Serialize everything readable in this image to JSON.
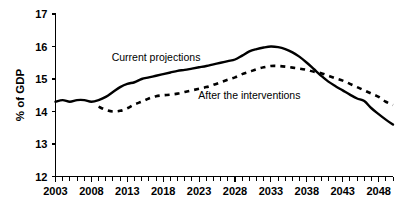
{
  "chart_data": {
    "type": "line",
    "title": "",
    "xlabel": "",
    "ylabel": "% of GDP",
    "xlim": [
      2003,
      2050
    ],
    "ylim": [
      12,
      17
    ],
    "grid": false,
    "legend_position": "inline-annotations",
    "y_ticks": [
      "17",
      "16",
      "15",
      "14",
      "13",
      "12"
    ],
    "y_tick_values": [
      17,
      16,
      15,
      14,
      13,
      12
    ],
    "x_ticks": [
      "2003",
      "2008",
      "2013",
      "2018",
      "2023",
      "2028",
      "2033",
      "2038",
      "2043",
      "2048"
    ],
    "x_tick_values": [
      2003,
      2008,
      2013,
      2018,
      2023,
      2028,
      2033,
      2038,
      2043,
      2048
    ],
    "x_minor_tick_interval": 1,
    "series": [
      {
        "name": "Current projections",
        "style": "solid",
        "label_x": 2017,
        "label_y": 15.55,
        "x": [
          2003,
          2004,
          2005,
          2006,
          2007,
          2008,
          2009,
          2010,
          2011,
          2012,
          2013,
          2014,
          2015,
          2016,
          2017,
          2018,
          2019,
          2020,
          2021,
          2022,
          2023,
          2024,
          2025,
          2026,
          2027,
          2028,
          2029,
          2030,
          2031,
          2032,
          2033,
          2034,
          2035,
          2036,
          2037,
          2038,
          2039,
          2040,
          2041,
          2042,
          2043,
          2044,
          2045,
          2046,
          2047,
          2048,
          2049,
          2050
        ],
        "values": [
          14.3,
          14.35,
          14.3,
          14.35,
          14.35,
          14.3,
          14.35,
          14.45,
          14.6,
          14.75,
          14.85,
          14.9,
          15.0,
          15.05,
          15.1,
          15.15,
          15.2,
          15.25,
          15.28,
          15.32,
          15.36,
          15.4,
          15.45,
          15.5,
          15.55,
          15.6,
          15.72,
          15.85,
          15.92,
          15.97,
          16.0,
          15.98,
          15.92,
          15.82,
          15.68,
          15.5,
          15.3,
          15.1,
          14.92,
          14.78,
          14.65,
          14.52,
          14.4,
          14.32,
          14.1,
          13.92,
          13.75,
          13.6
        ]
      },
      {
        "name": "After the interventions",
        "style": "dashed",
        "label_x": 2030,
        "label_y": 14.38,
        "x": [
          2009,
          2010,
          2011,
          2012,
          2013,
          2014,
          2015,
          2016,
          2017,
          2018,
          2019,
          2020,
          2021,
          2022,
          2023,
          2024,
          2025,
          2026,
          2027,
          2028,
          2029,
          2030,
          2031,
          2032,
          2033,
          2034,
          2035,
          2036,
          2037,
          2038,
          2039,
          2040,
          2041,
          2042,
          2043,
          2044,
          2045,
          2046,
          2047,
          2048,
          2049,
          2050
        ],
        "values": [
          14.15,
          14.05,
          14.0,
          14.02,
          14.1,
          14.22,
          14.3,
          14.4,
          14.47,
          14.5,
          14.52,
          14.55,
          14.6,
          14.65,
          14.7,
          14.75,
          14.82,
          14.9,
          14.98,
          15.05,
          15.15,
          15.22,
          15.3,
          15.36,
          15.4,
          15.4,
          15.38,
          15.35,
          15.32,
          15.28,
          15.22,
          15.18,
          15.1,
          15.02,
          14.95,
          14.85,
          14.75,
          14.65,
          14.55,
          14.45,
          14.3,
          14.2
        ]
      }
    ]
  }
}
